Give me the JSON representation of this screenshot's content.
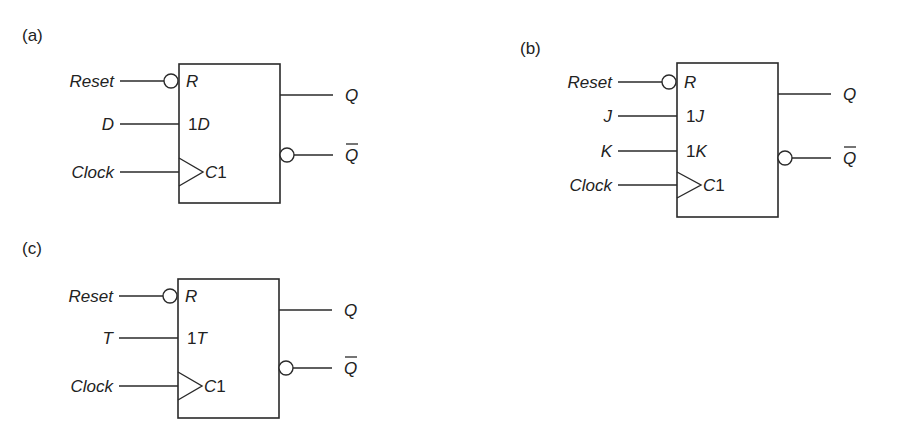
{
  "figure": {
    "colors": {
      "line": "#2a2a2a",
      "text": "#222222",
      "background": "#ffffff"
    },
    "panels": [
      {
        "id": "a",
        "label": "(a)",
        "type": "D flip-flop",
        "inputs": [
          {
            "signal": "Reset",
            "pin_prefix": "",
            "pin": "R",
            "inverted": true,
            "clock": false
          },
          {
            "signal": "D",
            "pin_prefix": "1",
            "pin": "D",
            "inverted": false,
            "clock": false
          },
          {
            "signal": "Clock",
            "pin_prefix": "",
            "pin": "C1",
            "inverted": false,
            "clock": true
          }
        ],
        "outputs": [
          {
            "signal": "Q",
            "inverted": false,
            "overbar": false
          },
          {
            "signal": "Q",
            "inverted": true,
            "overbar": true
          }
        ]
      },
      {
        "id": "b",
        "label": "(b)",
        "type": "JK flip-flop",
        "inputs": [
          {
            "signal": "Reset",
            "pin_prefix": "",
            "pin": "R",
            "inverted": true,
            "clock": false
          },
          {
            "signal": "J",
            "pin_prefix": "1",
            "pin": "J",
            "inverted": false,
            "clock": false
          },
          {
            "signal": "K",
            "pin_prefix": "1",
            "pin": "K",
            "inverted": false,
            "clock": false
          },
          {
            "signal": "Clock",
            "pin_prefix": "",
            "pin": "C1",
            "inverted": false,
            "clock": true
          }
        ],
        "outputs": [
          {
            "signal": "Q",
            "inverted": false,
            "overbar": false
          },
          {
            "signal": "Q",
            "inverted": true,
            "overbar": true
          }
        ]
      },
      {
        "id": "c",
        "label": "(c)",
        "type": "T flip-flop",
        "inputs": [
          {
            "signal": "Reset",
            "pin_prefix": "",
            "pin": "R",
            "inverted": true,
            "clock": false
          },
          {
            "signal": "T",
            "pin_prefix": "1",
            "pin": "T",
            "inverted": false,
            "clock": false
          },
          {
            "signal": "Clock",
            "pin_prefix": "",
            "pin": "C1",
            "inverted": false,
            "clock": true
          }
        ],
        "outputs": [
          {
            "signal": "Q",
            "inverted": false,
            "overbar": false
          },
          {
            "signal": "Q",
            "inverted": true,
            "overbar": true
          }
        ]
      }
    ]
  }
}
